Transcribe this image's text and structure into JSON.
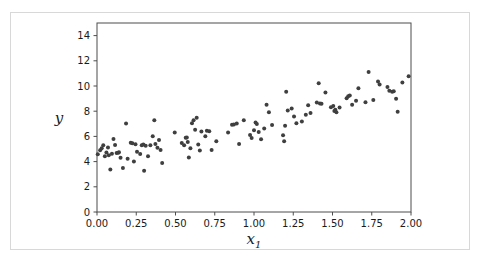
{
  "figure": {
    "background_color": "#ffffff",
    "border_color": "#d8d8d8",
    "axis_color": "#4d4d4d",
    "marker_color": "#3f3f3f"
  },
  "chart_data": {
    "type": "scatter",
    "title": "",
    "xlabel": "x₁",
    "xlabel_base": "x",
    "xlabel_sub": "1",
    "ylabel": "y",
    "xlim": [
      0.0,
      2.0
    ],
    "ylim": [
      0.0,
      15.0
    ],
    "grid": false,
    "legend": null,
    "xticks": [
      0.0,
      0.25,
      0.5,
      0.75,
      1.0,
      1.25,
      1.5,
      1.75,
      2.0
    ],
    "xticklabels": [
      "0.00",
      "0.25",
      "0.50",
      "0.75",
      "1.00",
      "1.25",
      "1.50",
      "1.75",
      "2.00"
    ],
    "yticks": [
      0,
      2,
      4,
      6,
      8,
      10,
      12,
      14
    ],
    "yticklabels": [
      "0",
      "2",
      "4",
      "6",
      "8",
      "10",
      "12",
      "14"
    ],
    "marker": "circle",
    "marker_size": 4,
    "n_points": 110,
    "points": [
      [
        0.005,
        4.58
      ],
      [
        0.02,
        4.9
      ],
      [
        0.03,
        5.05
      ],
      [
        0.04,
        5.3
      ],
      [
        0.05,
        4.42
      ],
      [
        0.06,
        4.72
      ],
      [
        0.07,
        5.12
      ],
      [
        0.075,
        4.5
      ],
      [
        0.085,
        3.38
      ],
      [
        0.095,
        4.62
      ],
      [
        0.105,
        5.8
      ],
      [
        0.115,
        5.32
      ],
      [
        0.125,
        4.68
      ],
      [
        0.135,
        4.7
      ],
      [
        0.14,
        4.75
      ],
      [
        0.15,
        4.3
      ],
      [
        0.165,
        3.5
      ],
      [
        0.185,
        7.02
      ],
      [
        0.195,
        4.22
      ],
      [
        0.215,
        5.5
      ],
      [
        0.225,
        5.45
      ],
      [
        0.235,
        4.0
      ],
      [
        0.245,
        5.38
      ],
      [
        0.255,
        4.78
      ],
      [
        0.275,
        4.6
      ],
      [
        0.285,
        5.3
      ],
      [
        0.295,
        5.35
      ],
      [
        0.3,
        3.28
      ],
      [
        0.31,
        5.25
      ],
      [
        0.325,
        4.42
      ],
      [
        0.34,
        5.3
      ],
      [
        0.355,
        6.02
      ],
      [
        0.365,
        7.28
      ],
      [
        0.372,
        5.4
      ],
      [
        0.385,
        5.1
      ],
      [
        0.395,
        5.72
      ],
      [
        0.405,
        4.92
      ],
      [
        0.415,
        3.88
      ],
      [
        0.495,
        6.3
      ],
      [
        0.54,
        5.48
      ],
      [
        0.555,
        5.3
      ],
      [
        0.565,
        5.9
      ],
      [
        0.572,
        5.92
      ],
      [
        0.578,
        5.55
      ],
      [
        0.585,
        4.32
      ],
      [
        0.595,
        5.05
      ],
      [
        0.605,
        7.05
      ],
      [
        0.615,
        7.28
      ],
      [
        0.625,
        6.52
      ],
      [
        0.635,
        7.48
      ],
      [
        0.645,
        5.35
      ],
      [
        0.655,
        4.88
      ],
      [
        0.665,
        6.38
      ],
      [
        0.69,
        6.02
      ],
      [
        0.7,
        6.45
      ],
      [
        0.715,
        6.4
      ],
      [
        0.73,
        4.92
      ],
      [
        0.76,
        5.62
      ],
      [
        0.835,
        6.3
      ],
      [
        0.86,
        6.92
      ],
      [
        0.872,
        6.95
      ],
      [
        0.89,
        7.02
      ],
      [
        0.905,
        5.4
      ],
      [
        0.935,
        7.28
      ],
      [
        0.975,
        6.12
      ],
      [
        0.985,
        5.88
      ],
      [
        1.0,
        6.48
      ],
      [
        1.01,
        7.1
      ],
      [
        1.018,
        6.98
      ],
      [
        1.03,
        6.35
      ],
      [
        1.045,
        5.78
      ],
      [
        1.065,
        6.62
      ],
      [
        1.08,
        8.52
      ],
      [
        1.095,
        7.92
      ],
      [
        1.115,
        6.9
      ],
      [
        1.185,
        6.1
      ],
      [
        1.192,
        5.62
      ],
      [
        1.198,
        6.85
      ],
      [
        1.205,
        9.55
      ],
      [
        1.215,
        8.05
      ],
      [
        1.24,
        8.22
      ],
      [
        1.255,
        7.58
      ],
      [
        1.27,
        7.05
      ],
      [
        1.305,
        7.18
      ],
      [
        1.33,
        7.72
      ],
      [
        1.345,
        8.48
      ],
      [
        1.36,
        7.85
      ],
      [
        1.4,
        8.7
      ],
      [
        1.412,
        10.22
      ],
      [
        1.42,
        8.62
      ],
      [
        1.43,
        8.6
      ],
      [
        1.455,
        9.48
      ],
      [
        1.49,
        8.32
      ],
      [
        1.505,
        8.42
      ],
      [
        1.512,
        8.02
      ],
      [
        1.518,
        8.12
      ],
      [
        1.525,
        7.92
      ],
      [
        1.545,
        8.3
      ],
      [
        1.59,
        9.02
      ],
      [
        1.6,
        9.18
      ],
      [
        1.61,
        9.25
      ],
      [
        1.625,
        8.52
      ],
      [
        1.65,
        8.82
      ],
      [
        1.665,
        9.82
      ],
      [
        1.71,
        8.72
      ],
      [
        1.73,
        11.12
      ],
      [
        1.76,
        8.88
      ],
      [
        1.79,
        10.35
      ],
      [
        1.8,
        10.12
      ],
      [
        1.85,
        9.92
      ],
      [
        1.862,
        9.62
      ],
      [
        1.88,
        9.55
      ],
      [
        1.89,
        9.58
      ],
      [
        1.905,
        8.98
      ],
      [
        1.915,
        7.95
      ],
      [
        1.945,
        10.28
      ],
      [
        1.985,
        10.78
      ]
    ]
  }
}
